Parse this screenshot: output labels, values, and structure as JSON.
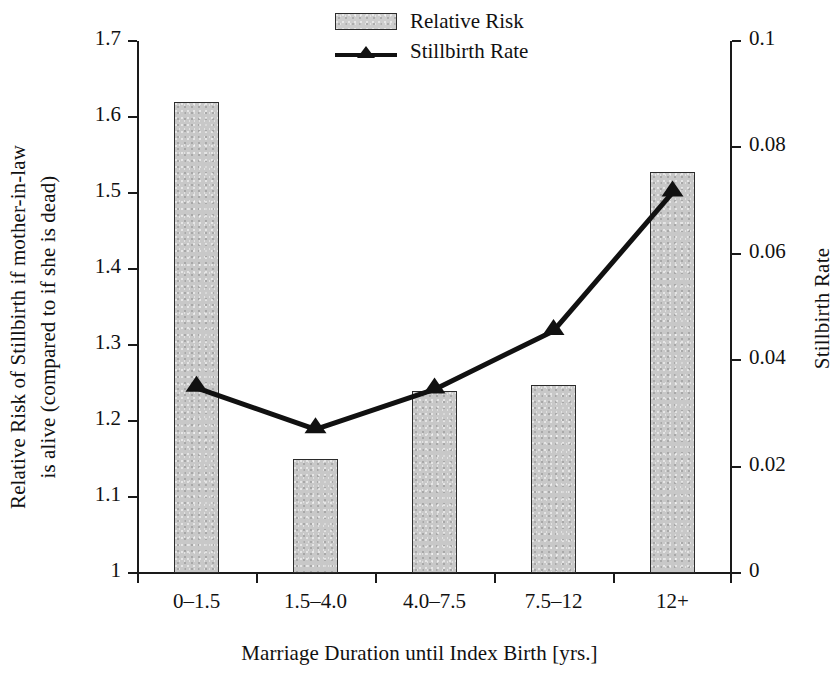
{
  "chart_data": {
    "type": "bar",
    "title": "",
    "categories": [
      "0–1.5",
      "1.5–4.0",
      "4.0–7.5",
      "7.5–12",
      "12+"
    ],
    "xlabel": "Marriage Duration until Index Birth [yrs.]",
    "ylabel": "Relative Risk of Stillbirth if mother-in-law is alive (compared to if she is dead)",
    "ylabel_line1": "Relative Risk of Stillbirth if mother-in-law",
    "ylabel_line2": "is alive (compared to if she is dead)",
    "y2label": "Stillbirth Rate",
    "ylim": [
      1,
      1.7
    ],
    "y2lim": [
      0,
      0.1
    ],
    "yticks": [
      "1",
      "1.1",
      "1.2",
      "1.3",
      "1.4",
      "1.5",
      "1.6",
      "1.7"
    ],
    "ytick_values": [
      1,
      1.1,
      1.2,
      1.3,
      1.4,
      1.5,
      1.6,
      1.7
    ],
    "y2ticks": [
      "0",
      "0.02",
      "0.04",
      "0.06",
      "0.08",
      "0.1"
    ],
    "y2tick_values": [
      0,
      0.02,
      0.04,
      0.06,
      0.08,
      0.1
    ],
    "grid": false,
    "legend_position": "top-center",
    "series": [
      {
        "name": "Relative Risk",
        "type": "bar",
        "axis": "left",
        "values": [
          1.62,
          1.15,
          1.24,
          1.247,
          1.527
        ]
      },
      {
        "name": "Stillbirth Rate",
        "type": "line",
        "axis": "right",
        "marker": "triangle",
        "values": [
          0.0348,
          0.027,
          0.0345,
          0.0455,
          0.0715
        ]
      }
    ]
  },
  "legend": {
    "items": [
      {
        "label": "Relative Risk",
        "glyph": "bar-swatch"
      },
      {
        "label": "Stillbirth Rate",
        "glyph": "line-triangle-swatch"
      }
    ]
  },
  "colors": {
    "bar_fill": "#c8c8c8",
    "bar_border": "#2b2b2b",
    "line": "#111111",
    "axis": "#1a1a1a",
    "background": "#ffffff"
  }
}
